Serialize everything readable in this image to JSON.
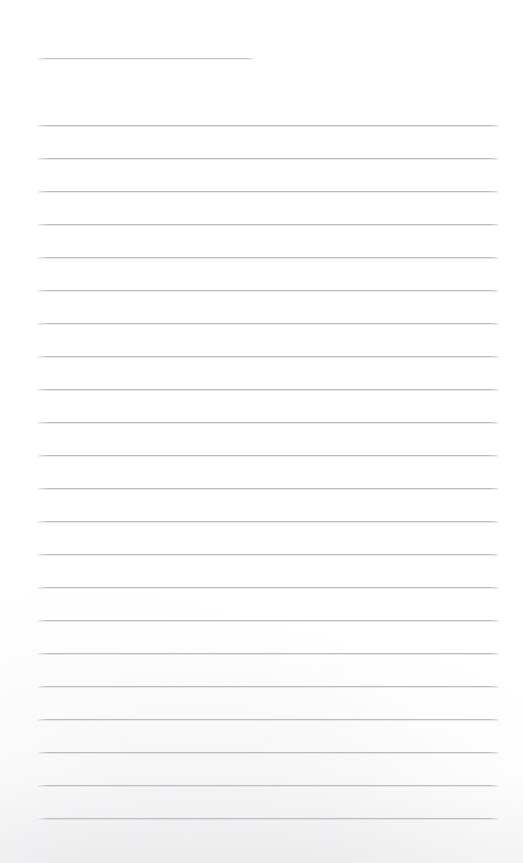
{
  "page": {
    "kind": "scanned-ruled-notepad-page",
    "width_px": 523,
    "height_px": 863,
    "background_color": "#ffffff",
    "content_text": "",
    "handwriting_present": "none",
    "printed_text_present": "none"
  },
  "rules": {
    "line_color": "#bcbcc0",
    "header_line_color": "#c3c3c7",
    "line_thickness_px": 1,
    "left_margin_px": 38,
    "right_edge_px": 498,
    "line_spacing_px": 33,
    "first_body_line_y_px": 125,
    "last_body_line_y_px": 818,
    "body_line_count": 22,
    "header_line": {
      "label": "header-rule",
      "y_px": 58,
      "left_px": 38,
      "right_px": 253,
      "width_px": 215
    },
    "body_lines": [
      {
        "label": "rule-1",
        "y_px": 125
      },
      {
        "label": "rule-2",
        "y_px": 158
      },
      {
        "label": "rule-3",
        "y_px": 191
      },
      {
        "label": "rule-4",
        "y_px": 224
      },
      {
        "label": "rule-5",
        "y_px": 257
      },
      {
        "label": "rule-6",
        "y_px": 290
      },
      {
        "label": "rule-7",
        "y_px": 323
      },
      {
        "label": "rule-8",
        "y_px": 356
      },
      {
        "label": "rule-9",
        "y_px": 389
      },
      {
        "label": "rule-10",
        "y_px": 422
      },
      {
        "label": "rule-11",
        "y_px": 455
      },
      {
        "label": "rule-12",
        "y_px": 488
      },
      {
        "label": "rule-13",
        "y_px": 521
      },
      {
        "label": "rule-14",
        "y_px": 554
      },
      {
        "label": "rule-15",
        "y_px": 587
      },
      {
        "label": "rule-16",
        "y_px": 620
      },
      {
        "label": "rule-17",
        "y_px": 653
      },
      {
        "label": "rule-18",
        "y_px": 686
      },
      {
        "label": "rule-19",
        "y_px": 719
      },
      {
        "label": "rule-20",
        "y_px": 752
      },
      {
        "label": "rule-21",
        "y_px": 785
      },
      {
        "label": "rule-22",
        "y_px": 818
      }
    ]
  },
  "margins": {
    "top_blank_px": 58,
    "bottom_blank_px": 45,
    "left_blank_px": 38,
    "right_blank_px": 25
  }
}
